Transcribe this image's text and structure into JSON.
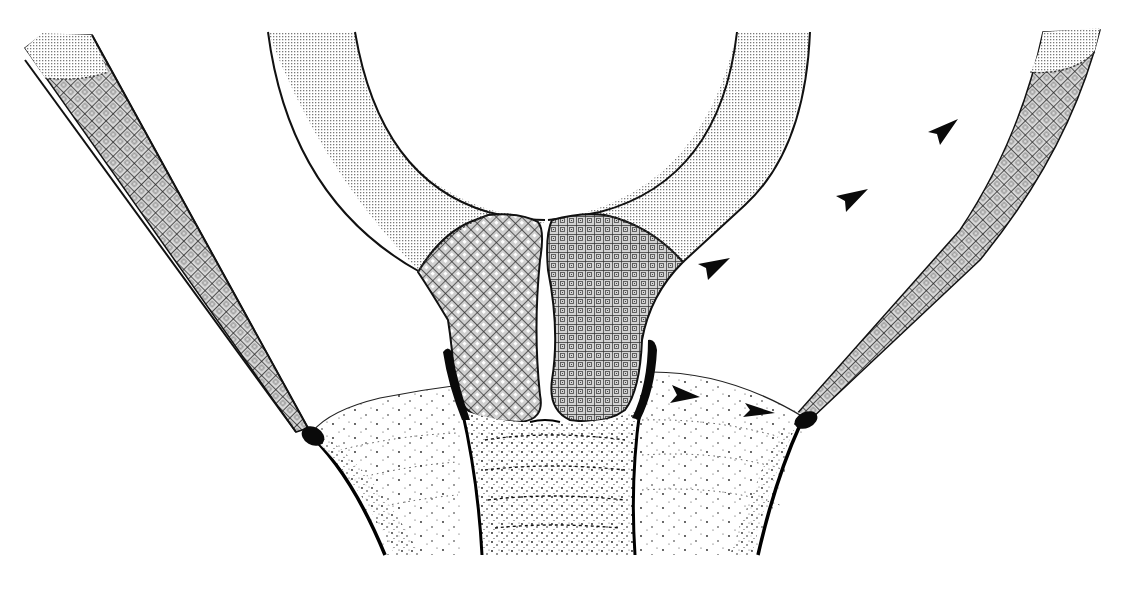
{
  "figure": {
    "type": "anatomical cross-section line illustration",
    "text_labels": [],
    "colors": {
      "background": "#ffffff",
      "outline": "#111111",
      "stipple": "#7a7a7a",
      "crosshatch": "#3a3a3a",
      "solid": "#0a0a0a"
    },
    "regions": [
      {
        "id": "left-band",
        "fill": "crosshatch",
        "cap_fill": "fine-stipple"
      },
      {
        "id": "right-band",
        "fill": "crosshatch",
        "cap_fill": "fine-stipple"
      },
      {
        "id": "central-arch-left",
        "fill": "fine-stipple"
      },
      {
        "id": "central-arch-right",
        "fill": "fine-stipple"
      },
      {
        "id": "left-lobe",
        "fill": "diamond-lattice"
      },
      {
        "id": "right-lobe",
        "fill": "square-grid"
      },
      {
        "id": "basal-dome",
        "fill": "sparse-dots"
      },
      {
        "id": "central-stem",
        "fill": "dense-dots"
      }
    ],
    "arrowheads": [
      {
        "x": 942,
        "y": 130,
        "direction": "up-right"
      },
      {
        "x": 852,
        "y": 200,
        "direction": "up-right"
      },
      {
        "x": 712,
        "y": 268,
        "direction": "up-right"
      },
      {
        "x": 685,
        "y": 395,
        "direction": "right"
      },
      {
        "x": 757,
        "y": 410,
        "direction": "right"
      }
    ],
    "arrowhead_count": 5
  }
}
